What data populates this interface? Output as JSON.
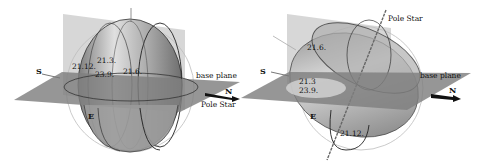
{
  "figure": {
    "panels": [
      {
        "id": "left",
        "labels": {
          "south": "S",
          "north": "N",
          "east": "E",
          "base_plane": "base plane",
          "pole_star": "Pole Star",
          "date_1": "21.12.",
          "date_2": "21.3.",
          "date_3": "23.9.",
          "date_4": "21.6."
        }
      },
      {
        "id": "right",
        "labels": {
          "south": "S",
          "north": "N",
          "east": "E",
          "base_plane": "base plane",
          "pole_star": "Pole Star",
          "date_1": "21.6.",
          "date_2": "21.3",
          "date_3": "23.9.",
          "date_4": "21.12."
        }
      }
    ],
    "colors": {
      "plane": "#8a8a8a",
      "vertical_plane": "#b8b8b8",
      "surface": "#a9a9a9",
      "outline": "#222222",
      "sphere": "#bdbdbd"
    }
  }
}
